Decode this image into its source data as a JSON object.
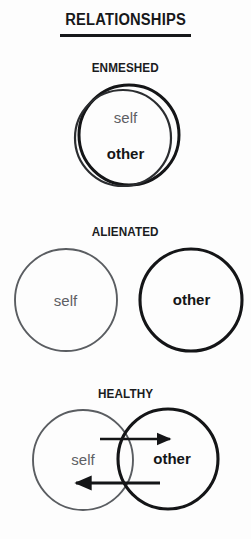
{
  "page": {
    "title": "RELATIONSHIPS",
    "background_color": "#fdfdfd",
    "ink_color": "#141517",
    "self_color": "#5d6064",
    "other_color": "#141517"
  },
  "sections": [
    {
      "id": "enmeshed",
      "label": "ENMESHED",
      "self_label": "self",
      "other_label": "other",
      "description": "Two circles almost completely overlapping"
    },
    {
      "id": "alienated",
      "label": "ALIENATED",
      "self_label": "self",
      "other_label": "other",
      "description": "Two separate non-touching circles"
    },
    {
      "id": "healthy",
      "label": "HEALTHY",
      "self_label": "self",
      "other_label": "other",
      "description": "Two partially overlapping circles with arrows in both directions",
      "arrows": [
        {
          "id": "arrow-right",
          "direction": "right"
        },
        {
          "id": "arrow-left",
          "direction": "left"
        }
      ]
    }
  ]
}
